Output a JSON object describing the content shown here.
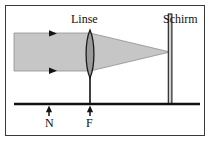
{
  "figure": {
    "kind": "optics-ray-diagram",
    "caption_language": "German",
    "labels": {
      "lens": "Linse",
      "screen": "Schirm",
      "point_n": "N",
      "point_f": "F"
    },
    "colors": {
      "beam_fill": "#c6c6c6",
      "beam_edge": "#8f8f8f",
      "lens_fill": "#9a9a9a",
      "lens_edge": "#1a1a1a",
      "line": "#101010",
      "border": "#3a3a3a",
      "background": "#ffffff"
    },
    "geometry": {
      "border": {
        "x": 5,
        "y": 5,
        "width": 200,
        "height": 131
      },
      "optical_axis_y": 104,
      "axis_x_start": 14,
      "axis_x_end": 200,
      "beam_left_x": 14,
      "beam_top_y": 33,
      "beam_bottom_y": 71,
      "lens_x": 90,
      "lens_top_y": 30,
      "lens_bottom_y": 78,
      "lens_half_width": 4.5,
      "focus_x": 170,
      "focus_y": 52,
      "screen_x": 170,
      "screen_top_y": 14,
      "screen_bottom_y": 104,
      "marker_n_x": 49,
      "marker_f_x": 90,
      "arrowheads_x": 53
    }
  }
}
